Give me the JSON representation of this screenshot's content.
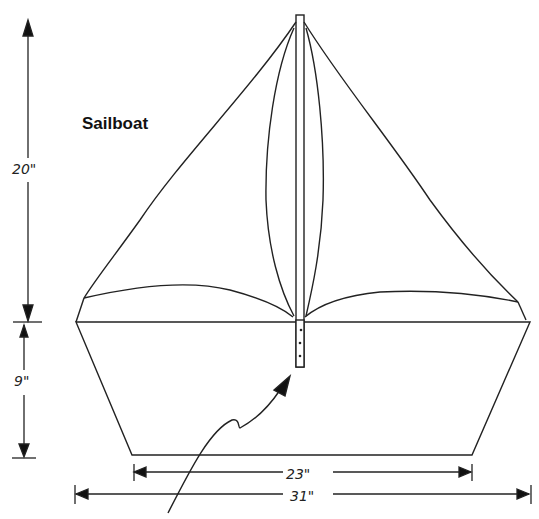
{
  "title": "Sailboat",
  "dimensions": {
    "sail_height": "20\"",
    "hull_height": "9\"",
    "hull_bottom_width": "23\"",
    "hull_top_width": "31\""
  },
  "colors": {
    "line": "#222222",
    "background": "#ffffff"
  }
}
